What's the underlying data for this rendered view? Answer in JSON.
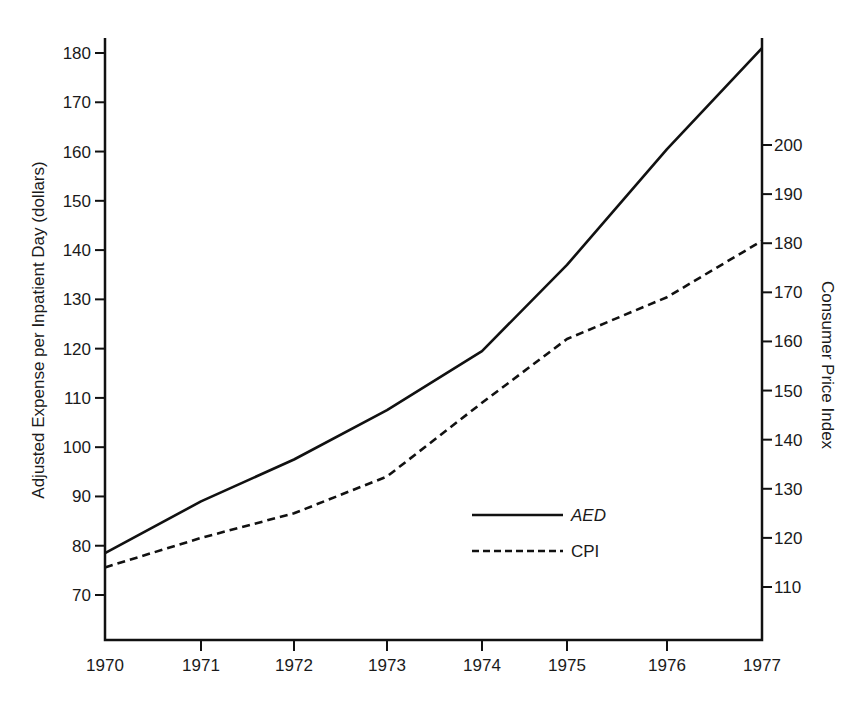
{
  "chart_data": {
    "type": "line",
    "title": "",
    "xlabel": "",
    "ylabel": "Adjusted Expense per Inpatient Day (dollars)",
    "y2label": "Consumer Price Index",
    "x": [
      "1970",
      "1971",
      "1972",
      "1973",
      "1974",
      "1975",
      "1976",
      "1977"
    ],
    "series": [
      {
        "name": "AED",
        "axis": "left",
        "style": "solid",
        "values": [
          78.5,
          89,
          97.5,
          107.5,
          119.5,
          137,
          160.5,
          181
        ]
      },
      {
        "name": "CPI",
        "axis": "right",
        "style": "dashed",
        "values": [
          114,
          120,
          125,
          132.5,
          147.5,
          160.5,
          169,
          180.5
        ]
      }
    ],
    "left_axis": {
      "ticks": [
        70,
        80,
        90,
        100,
        110,
        120,
        130,
        140,
        150,
        160,
        170,
        180
      ],
      "range": [
        61,
        183
      ]
    },
    "right_axis": {
      "ticks": [
        110,
        120,
        130,
        140,
        150,
        160,
        170,
        180,
        190,
        200
      ],
      "range": [
        100,
        221
      ]
    },
    "grid": false,
    "legend": {
      "position": "inside-lower-right",
      "entries": [
        {
          "label": "AED",
          "style": "solid",
          "italic": true
        },
        {
          "label": "CPI",
          "style": "dashed",
          "italic": false
        }
      ]
    },
    "colors": {
      "line": "#111111",
      "axis": "#111111",
      "background": "#ffffff"
    }
  }
}
